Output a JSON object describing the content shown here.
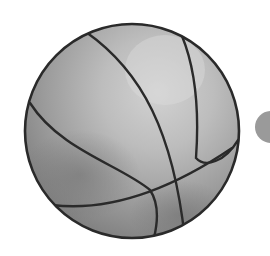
{
  "image": {
    "subject": "basketball illustration",
    "style": "grayscale",
    "colors": {
      "background": "#ffffff",
      "ball_light": "#c4c4c4",
      "ball_mid": "#a8a8a8",
      "ball_dark": "#7a7a7a",
      "seam": "#2a2a2a",
      "side_circle": "#9a9a9a"
    }
  },
  "shapes": {
    "basketball": {
      "cx": 132,
      "cy": 131,
      "r": 107
    },
    "side_circle": {
      "cx": 271,
      "cy": 127,
      "r": 16
    }
  }
}
